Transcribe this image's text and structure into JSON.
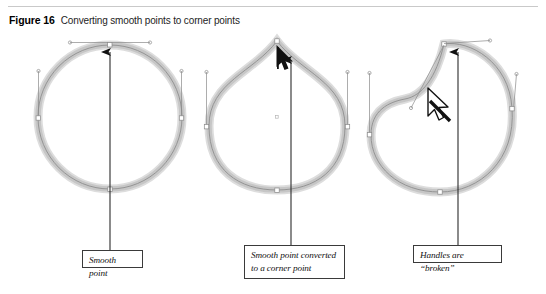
{
  "figure": {
    "label": "Figure 16",
    "title": "Converting smooth points to corner points"
  },
  "callouts": [
    {
      "id": "smooth-point",
      "text": "Smooth point"
    },
    {
      "id": "corner-point",
      "line1": "Smooth point converted",
      "line2": "to a corner point"
    },
    {
      "id": "broken-handles",
      "text": "Handles are “broken”"
    }
  ],
  "panels": [
    {
      "name": "smooth-point-circle",
      "description": "Circle path with a smooth anchor point at top and two collinear direction handles",
      "anchors": [
        "top",
        "left",
        "right",
        "bottom"
      ],
      "pointer": "up-arrow"
    },
    {
      "name": "corner-point-teardrop",
      "description": "Same path after the top smooth point was converted to a corner point, producing a peak",
      "anchors": [
        "top-corner",
        "left",
        "right",
        "bottom"
      ],
      "pointer": "up-arrow"
    },
    {
      "name": "broken-handles-shape",
      "description": "Corner point whose handles are broken and dragged independently, creating a dent",
      "anchors": [
        "top-corner",
        "left",
        "right",
        "bottom"
      ],
      "pointer": "direct-selection-arrow"
    }
  ],
  "colors": {
    "path_stroke": "#d0d0d0",
    "path_inner": "#9a9a9a",
    "handle_line": "#777777",
    "callout_border": "#3a3a3a",
    "leader_line": "#2b2b2b",
    "arrow": "#111111",
    "rule": "#c9c9c9"
  }
}
